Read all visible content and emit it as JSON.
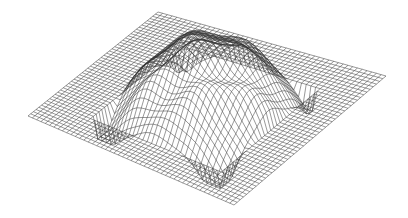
{
  "figure": {
    "type": "3d-wireframe-surface",
    "line_color": "#333333",
    "background": "#ffffff",
    "grid_resolution": 48,
    "corners": {
      "back": [
        158,
        12
      ],
      "right": [
        386,
        76
      ],
      "front": [
        234,
        205
      ],
      "left": [
        28,
        116
      ]
    },
    "height_scale": 38
  }
}
